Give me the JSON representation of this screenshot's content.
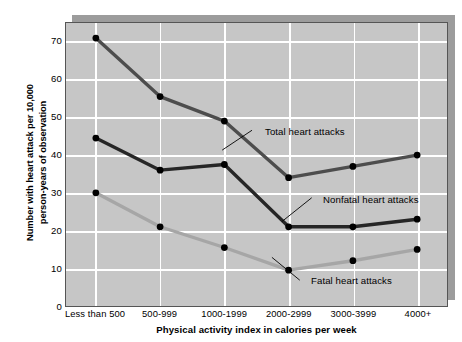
{
  "chart_data": {
    "type": "line",
    "title": "",
    "xlabel": "Physical activity index in calories per week",
    "ylabel_line1": "Number with heart attack per 10,000",
    "ylabel_line2": "person-years of observation",
    "categories": [
      "Less than 500",
      "500-999",
      "1000-1999",
      "2000-2999",
      "3000-3999",
      "4000+"
    ],
    "ylim": [
      0,
      75
    ],
    "yticks": [
      0,
      10,
      20,
      30,
      40,
      50,
      60,
      70
    ],
    "grid": true,
    "legend_position": "inline-annotations",
    "series": [
      {
        "name": "Total heart attacks",
        "color": "#4d4d4d",
        "values": [
          71,
          55.5,
          49,
          34,
          37,
          40
        ]
      },
      {
        "name": "Nonfatal heart attacks",
        "color": "#262626",
        "values": [
          44.5,
          36,
          37.5,
          21,
          21,
          23
        ]
      },
      {
        "name": "Fatal heart attacks",
        "color": "#a6a6a6",
        "values": [
          30,
          21,
          15.5,
          9.5,
          12,
          15
        ]
      }
    ],
    "annotations": [
      {
        "label": "Total heart attacks",
        "x": 264,
        "y": 131
      },
      {
        "label": "Nonfatal heart attacks",
        "x": 322,
        "y": 199
      },
      {
        "label": "Fatal heart attacks",
        "x": 310,
        "y": 280
      }
    ]
  },
  "style": {
    "plot_background": "#c6c6c6",
    "grid_color": "#ffffff",
    "shadow_color": "#9c9c9c",
    "page_background": "#ffffff",
    "marker_color": "#000000"
  }
}
